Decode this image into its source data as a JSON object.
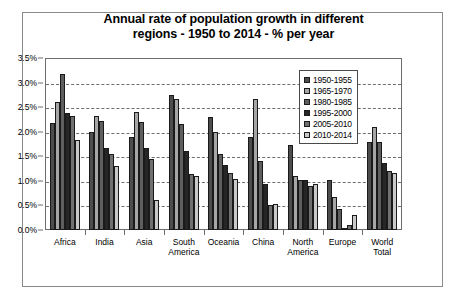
{
  "chart_data": {
    "type": "bar",
    "title": "Annual rate of population growth in different regions - 1950 to 2014 - % per year",
    "title_line1": "Annual rate of population growth in different",
    "title_line2": "regions - 1950 to 2014 - % per year",
    "xlabel": "",
    "ylabel": "",
    "ylim": [
      0,
      3.5
    ],
    "ytick_values": [
      0.0,
      0.5,
      1.0,
      1.5,
      2.0,
      2.5,
      3.0,
      3.5
    ],
    "ytick_labels": [
      "0.0%",
      "0.5%",
      "1.0%",
      "1.5%",
      "2.0%",
      "2.5%",
      "3.0%",
      "3.5%"
    ],
    "grid": true,
    "legend_position": "upper right",
    "categories": [
      "Africa",
      "India",
      "Asia",
      "South\nAmerica",
      "Oceania",
      "China",
      "North\nAmerica",
      "Europe",
      "World\nTotal"
    ],
    "series": [
      {
        "name": "1950-1955",
        "color": "#4d4d4d",
        "values": [
          2.17,
          2.0,
          1.89,
          2.74,
          2.29,
          1.9,
          1.72,
          1.02,
          1.8
        ]
      },
      {
        "name": "1965-1970",
        "color": "#a6a6a6",
        "values": [
          2.6,
          2.32,
          2.4,
          2.67,
          1.99,
          2.67,
          1.1,
          0.67,
          2.1
        ]
      },
      {
        "name": "1980-1985",
        "color": "#5e5e5e",
        "values": [
          3.18,
          2.21,
          2.2,
          2.15,
          1.55,
          1.41,
          1.02,
          0.42,
          1.8
        ]
      },
      {
        "name": "1995-2000",
        "color": "#262626",
        "values": [
          2.38,
          1.66,
          1.66,
          1.6,
          1.32,
          0.94,
          1.02,
          0.05,
          1.36
        ]
      },
      {
        "name": "2005-2010",
        "color": "#707070",
        "values": [
          2.33,
          1.55,
          1.44,
          1.14,
          1.16,
          0.5,
          0.9,
          0.11,
          1.21
        ]
      },
      {
        "name": "2010-2014",
        "color": "#c9c9c9",
        "values": [
          1.84,
          1.31,
          0.62,
          1.1,
          1.04,
          0.52,
          0.94,
          0.3,
          1.17
        ]
      }
    ]
  }
}
